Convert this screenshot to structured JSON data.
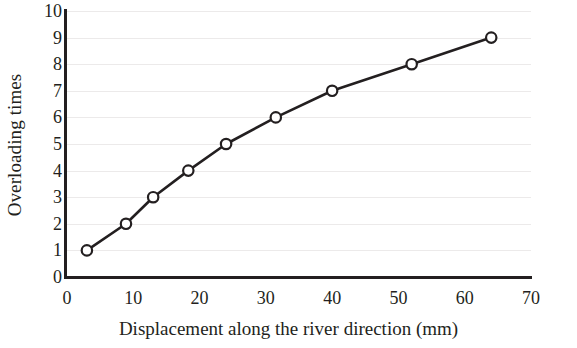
{
  "chart_data": {
    "type": "line",
    "title": "",
    "xlabel": "Displacement along the river direction (mm)",
    "ylabel": "Overloading times",
    "xlim": [
      0,
      70
    ],
    "ylim": [
      0,
      10
    ],
    "xticks": [
      0,
      10,
      20,
      30,
      40,
      50,
      60,
      70
    ],
    "yticks": [
      0,
      1,
      2,
      3,
      4,
      5,
      6,
      7,
      8,
      9,
      10
    ],
    "xtick_labels": [
      "0",
      "10",
      "20",
      "30",
      "40",
      "50",
      "60",
      "70"
    ],
    "ytick_labels": [
      "0",
      "1",
      "2",
      "3",
      "4",
      "5",
      "6",
      "7",
      "8",
      "9",
      "10"
    ],
    "grid": "horizontal",
    "grid_color": "#eceaea",
    "legend": null,
    "series": [
      {
        "name": "Overloading times vs displacement",
        "marker": "open-circle",
        "line_color": "#231f20",
        "marker_face_color": "#ffffff",
        "marker_edge_color": "#231f20",
        "x": [
          3.0,
          8.9,
          13.0,
          18.3,
          24.0,
          31.5,
          40.0,
          52.0,
          64.0
        ],
        "y": [
          1,
          2,
          3,
          4,
          5,
          6,
          7,
          8,
          9
        ]
      }
    ]
  },
  "axes": {
    "x_title": "Displacement along the river direction (mm)",
    "y_title": "Overloading times"
  }
}
